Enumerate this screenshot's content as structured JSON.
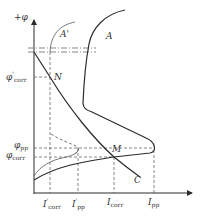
{
  "diagram": {
    "colors": {
      "curve": "#2a2a2a",
      "guide": "#555555",
      "background": "#ffffff"
    },
    "axes": {
      "y_label": "+φ",
      "x_origin": [
        34,
        193
      ]
    },
    "curve_labels": {
      "A": "A",
      "A_prime": "A'",
      "N": "N",
      "M": "M",
      "C": "C"
    },
    "y_ticks": {
      "phi_corr_prime": {
        "sym": "φ",
        "sup": "'",
        "sub": "corr"
      },
      "phi_pp": {
        "sym": "φ",
        "sub": "pp"
      },
      "phi_corr": {
        "sym": "φ",
        "sub": "corr"
      }
    },
    "x_ticks": {
      "I_corr_prime": {
        "sym": "I",
        "sup": "'",
        "sub": "corr"
      },
      "I_pp_prime": {
        "sym": "I",
        "sup": "'",
        "sub": "pp"
      },
      "I_corr": {
        "sym": "I",
        "sub": "corr"
      },
      "I_pp": {
        "sym": "I",
        "sub": "pp"
      }
    }
  }
}
